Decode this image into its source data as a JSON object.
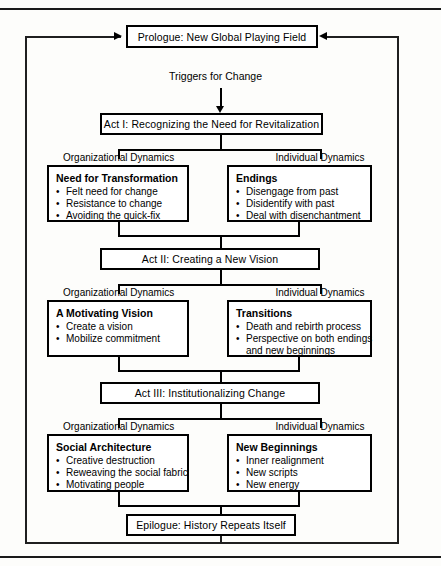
{
  "figure": {
    "prologue": {
      "label": "Prologue: New Global Playing Field"
    },
    "trigger": {
      "label": "Triggers for Change"
    },
    "epilogue": {
      "label": "Epilogue: History Repeats Itself"
    },
    "captions": {
      "organizational": "Organizational Dynamics",
      "individual": "Individual Dynamics"
    },
    "acts": [
      {
        "id": "act-1",
        "title": "Act I: Recognizing the Need for Revitalization",
        "organizational": {
          "title": "Need for Transformation",
          "items": [
            "Felt need for change",
            "Resistance to change",
            "Avoiding the quick-fix"
          ]
        },
        "individual": {
          "title": "Endings",
          "items": [
            "Disengage from past",
            "Disidentify with past",
            "Deal with disenchantment"
          ]
        }
      },
      {
        "id": "act-2",
        "title": "Act II: Creating a New Vision",
        "organizational": {
          "title": "A Motivating Vision",
          "items": [
            "Create a vision",
            "Mobilize commitment"
          ]
        },
        "individual": {
          "title": "Transitions",
          "items": [
            "Death and rebirth process",
            "Perspective on both endings and new beginnings"
          ]
        }
      },
      {
        "id": "act-3",
        "title": "Act III: Institutionalizing Change",
        "organizational": {
          "title": "Social Architecture",
          "items": [
            "Creative destruction",
            "Reweaving the social fabric",
            "Motivating people"
          ]
        },
        "individual": {
          "title": "New Beginnings",
          "items": [
            "Inner realignment",
            "New scripts",
            "New energy"
          ]
        }
      }
    ],
    "colors": {
      "line": "#000000",
      "background": "#fdfdfb",
      "box_fill": "#ffffff"
    }
  }
}
